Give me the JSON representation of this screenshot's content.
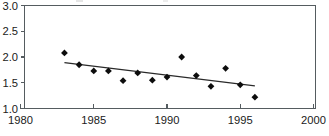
{
  "chart_data": {
    "type": "scatter",
    "title": "",
    "subtitle": "",
    "xlabel": "",
    "ylabel": "",
    "xlim": [
      1980,
      2000
    ],
    "ylim": [
      1.0,
      3.0
    ],
    "xticks": [
      1980,
      1985,
      1990,
      1995,
      2000
    ],
    "xtick_labels": [
      "1980",
      "1985",
      "1990",
      "1995",
      "2000"
    ],
    "yticks": [
      1.0,
      1.5,
      2.0,
      2.5,
      3.0
    ],
    "ytick_labels": [
      "1.0",
      "1.5",
      "2.0",
      "2.5",
      "3.0"
    ],
    "grid": false,
    "legend": null,
    "marker_style": "filled-diamond",
    "marker_color": "#0d0d0d",
    "trendline_color": "#2a2a2a",
    "axis_color": "#555c60",
    "x": [
      1983,
      1984,
      1985,
      1986,
      1987,
      1988,
      1989,
      1990,
      1991,
      1992,
      1993,
      1994,
      1995,
      1996
    ],
    "values": [
      2.08,
      1.85,
      1.73,
      1.73,
      1.54,
      1.69,
      1.55,
      1.61,
      2.0,
      1.64,
      1.43,
      1.78,
      1.46,
      1.22
    ],
    "series": [
      {
        "name": "observations",
        "type": "scatter",
        "values": [
          2.08,
          1.85,
          1.73,
          1.73,
          1.54,
          1.69,
          1.55,
          1.61,
          2.0,
          1.64,
          1.43,
          1.78,
          1.46,
          1.22
        ]
      },
      {
        "name": "linear-trend",
        "type": "line",
        "x": [
          1983,
          1996
        ],
        "values": [
          1.89,
          1.44
        ]
      }
    ],
    "annotations": []
  },
  "axes": {
    "y_top_label": "3.0",
    "y_label_2": "2.5",
    "y_label_3": "2.0",
    "y_label_4": "1.5",
    "y_bottom_label": "1.0",
    "x_first_label": "1980",
    "x_second_label": "1985",
    "x_third_label": "1990",
    "x_fourth_label": "1995",
    "x_last_label": "2000"
  }
}
